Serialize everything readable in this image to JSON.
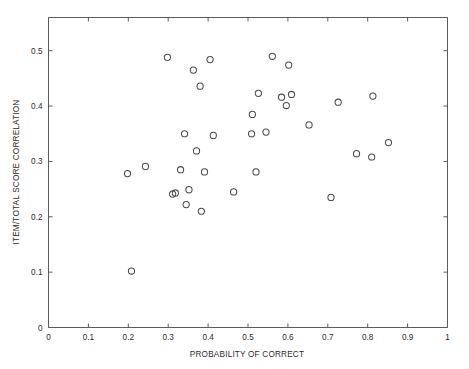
{
  "chart_data": {
    "type": "scatter",
    "title": "",
    "xlabel": "PROBABILITY OF CORRECT",
    "ylabel": "ITEM/TOTAL SCORE CORRELATION",
    "xlim": [
      0,
      1
    ],
    "ylim": [
      0,
      0.56
    ],
    "grid": false,
    "legend": null,
    "marker": "open-circle",
    "marker_color": "#4a4a4a",
    "xticks": [
      0,
      0.1,
      0.2,
      0.3,
      0.4,
      0.5,
      0.6,
      0.7,
      0.8,
      0.9,
      1
    ],
    "xticklabels": [
      "0",
      "0.1",
      "0.2",
      "0.3",
      "0.4",
      "0.5",
      "0.6",
      "0.7",
      "0.8",
      "0.9",
      "1"
    ],
    "yticks": [
      0,
      0.1,
      0.2,
      0.3,
      0.4,
      0.5
    ],
    "yticklabels": [
      "0",
      "0.1",
      "0.2",
      "0.3",
      "0.4",
      "0.5"
    ],
    "n_points": 35,
    "points": [
      {
        "x": 0.198,
        "y": 0.278
      },
      {
        "x": 0.208,
        "y": 0.102
      },
      {
        "x": 0.243,
        "y": 0.291
      },
      {
        "x": 0.298,
        "y": 0.488
      },
      {
        "x": 0.311,
        "y": 0.241
      },
      {
        "x": 0.318,
        "y": 0.243
      },
      {
        "x": 0.331,
        "y": 0.285
      },
      {
        "x": 0.341,
        "y": 0.35
      },
      {
        "x": 0.345,
        "y": 0.222
      },
      {
        "x": 0.352,
        "y": 0.249
      },
      {
        "x": 0.363,
        "y": 0.465
      },
      {
        "x": 0.371,
        "y": 0.319
      },
      {
        "x": 0.38,
        "y": 0.436
      },
      {
        "x": 0.383,
        "y": 0.21
      },
      {
        "x": 0.391,
        "y": 0.281
      },
      {
        "x": 0.405,
        "y": 0.484
      },
      {
        "x": 0.413,
        "y": 0.347
      },
      {
        "x": 0.464,
        "y": 0.245
      },
      {
        "x": 0.509,
        "y": 0.35
      },
      {
        "x": 0.511,
        "y": 0.385
      },
      {
        "x": 0.52,
        "y": 0.281
      },
      {
        "x": 0.526,
        "y": 0.423
      },
      {
        "x": 0.545,
        "y": 0.353
      },
      {
        "x": 0.561,
        "y": 0.49
      },
      {
        "x": 0.584,
        "y": 0.416
      },
      {
        "x": 0.596,
        "y": 0.401
      },
      {
        "x": 0.602,
        "y": 0.474
      },
      {
        "x": 0.609,
        "y": 0.421
      },
      {
        "x": 0.653,
        "y": 0.366
      },
      {
        "x": 0.708,
        "y": 0.235
      },
      {
        "x": 0.726,
        "y": 0.407
      },
      {
        "x": 0.772,
        "y": 0.314
      },
      {
        "x": 0.81,
        "y": 0.308
      },
      {
        "x": 0.813,
        "y": 0.418
      },
      {
        "x": 0.852,
        "y": 0.334
      }
    ]
  },
  "axes": {
    "x_title": "PROBABILITY OF CORRECT",
    "y_title": "ITEM/TOTAL SCORE CORRELATION"
  }
}
